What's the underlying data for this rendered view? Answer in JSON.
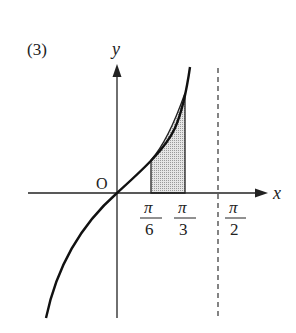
{
  "problem_label": "(3)",
  "axes": {
    "x_label": "x",
    "y_label": "y",
    "origin_label": "O"
  },
  "ticks": [
    {
      "num": "π",
      "den": "6"
    },
    {
      "num": "π",
      "den": "3"
    },
    {
      "num": "π",
      "den": "2"
    }
  ],
  "curve": "y = tan x",
  "shaded_region": {
    "from": "π/6",
    "to": "π/3"
  },
  "asymptote": "x = π/2",
  "colors": {
    "line": "#222222",
    "shade": "#d8d8d8"
  }
}
